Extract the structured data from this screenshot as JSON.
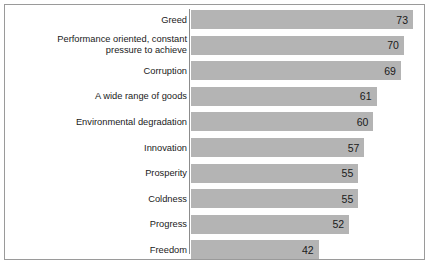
{
  "chart_data": {
    "type": "bar",
    "orientation": "horizontal",
    "title": "",
    "subtitle": "",
    "xlabel": "",
    "ylabel": "",
    "xlim": [
      0,
      75
    ],
    "grid": false,
    "legend": null,
    "bar_color": "#b4b4b4",
    "text_color": "#1a1a1a",
    "frame_color": "#9a9a9a",
    "axis_line_color": "#8c8c8c",
    "value_label_position": "inside-end",
    "categories": [
      "Greed",
      "Performance oriented, constant\npressure to achieve",
      "Corruption",
      "A wide range of goods",
      "Environmental degradation",
      "Innovation",
      "Prosperity",
      "Coldness",
      "Progress",
      "Freedom"
    ],
    "values": [
      73,
      70,
      69,
      61,
      60,
      57,
      55,
      55,
      52,
      42
    ],
    "value_labels": [
      "73",
      "70",
      "69",
      "61",
      "60",
      "57",
      "55",
      "55",
      "52",
      "42"
    ]
  }
}
